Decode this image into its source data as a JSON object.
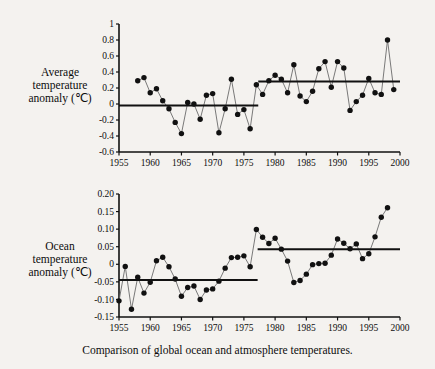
{
  "figure": {
    "caption": "Comparison of global ocean and atmosphere temperatures."
  },
  "chart_data": [
    {
      "type": "scatter",
      "name": "average-temperature-anomaly",
      "title": "",
      "xlabel": "",
      "ylabel": "Average temperature anomaly (℃)",
      "ylabel_lines": [
        "Average",
        "temperature",
        "anomaly (℃)"
      ],
      "xlim": [
        1955,
        2000
      ],
      "ylim": [
        -0.6,
        1.0
      ],
      "xticks": [
        1955,
        1960,
        1965,
        1970,
        1975,
        1980,
        1985,
        1990,
        1995,
        2000
      ],
      "xtick_labels": [
        "1955",
        "1960",
        "1965",
        "1970",
        "1975",
        "1980",
        "1985",
        "1990",
        "1995",
        "2000"
      ],
      "yticks": [
        -0.6,
        -0.4,
        -0.2,
        0,
        0.2,
        0.4,
        0.6,
        0.8,
        1.0
      ],
      "ytick_labels": [
        "-0.6",
        "-0.4",
        "-0.2",
        "0",
        "0.2",
        "0.4",
        "0.6",
        "0.8",
        "1"
      ],
      "grid": false,
      "legend": false,
      "marker": "filled-circle",
      "connected": true,
      "x": [
        1958,
        1959,
        1960,
        1961,
        1962,
        1963,
        1964,
        1965,
        1966,
        1967,
        1968,
        1969,
        1970,
        1971,
        1972,
        1973,
        1974,
        1975,
        1976,
        1977,
        1978,
        1979,
        1980,
        1981,
        1982,
        1983,
        1984,
        1985,
        1986,
        1987,
        1988,
        1989,
        1990,
        1991,
        1992,
        1993,
        1994,
        1995,
        1996,
        1997,
        1998,
        1999
      ],
      "y": [
        0.29,
        0.33,
        0.14,
        0.19,
        0.04,
        -0.06,
        -0.23,
        -0.37,
        0.02,
        0.0,
        -0.19,
        0.11,
        0.13,
        -0.36,
        -0.06,
        0.31,
        -0.13,
        -0.07,
        -0.31,
        0.24,
        0.12,
        0.29,
        0.36,
        0.31,
        0.14,
        0.49,
        0.1,
        0.03,
        0.16,
        0.44,
        0.53,
        0.21,
        0.53,
        0.45,
        -0.08,
        0.03,
        0.11,
        0.32,
        0.14,
        0.12,
        0.8,
        0.18
      ],
      "trend_lines": [
        {
          "name": "mean-1955-1977",
          "x0": 1955,
          "x1": 1977.3,
          "value": -0.02
        },
        {
          "name": "mean-1977-2000",
          "x0": 1977.3,
          "x1": 2000,
          "value": 0.28
        }
      ]
    },
    {
      "type": "scatter",
      "name": "ocean-temperature-anomaly",
      "title": "",
      "xlabel": "",
      "ylabel": "Ocean temperature anomaly (℃)",
      "ylabel_lines": [
        "Ocean",
        "temperature",
        "anomaly (℃)"
      ],
      "xlim": [
        1955,
        2000
      ],
      "ylim": [
        -0.15,
        0.2
      ],
      "xticks": [
        1955,
        1960,
        1965,
        1970,
        1975,
        1980,
        1985,
        1990,
        1995,
        2000
      ],
      "xtick_labels": [
        "1955",
        "1960",
        "1965",
        "1970",
        "1975",
        "1980",
        "1985",
        "1990",
        "1995",
        "2000"
      ],
      "yticks": [
        -0.15,
        -0.1,
        -0.05,
        0,
        0.05,
        0.1,
        0.15,
        0.2
      ],
      "ytick_labels": [
        "-0.15",
        "-0.10",
        "-0.05",
        "0",
        "0.05",
        "0.10",
        "0.15",
        "0.20"
      ],
      "grid": false,
      "legend": false,
      "marker": "filled-circle",
      "connected": true,
      "x": [
        1955,
        1956,
        1957,
        1958,
        1959,
        1960,
        1961,
        1962,
        1963,
        1964,
        1965,
        1966,
        1967,
        1968,
        1969,
        1970,
        1971,
        1972,
        1973,
        1974,
        1975,
        1976,
        1977,
        1978,
        1979,
        1980,
        1981,
        1982,
        1983,
        1984,
        1985,
        1986,
        1987,
        1988,
        1989,
        1990,
        1991,
        1992,
        1993,
        1994,
        1995,
        1996,
        1997,
        1998
      ],
      "y": [
        -0.104,
        -0.006,
        -0.128,
        -0.037,
        -0.082,
        -0.051,
        0.01,
        0.02,
        -0.007,
        -0.042,
        -0.091,
        -0.066,
        -0.062,
        -0.1,
        -0.073,
        -0.07,
        -0.048,
        -0.011,
        0.019,
        0.02,
        0.024,
        -0.007,
        0.099,
        0.077,
        0.059,
        0.074,
        0.043,
        0.009,
        -0.052,
        -0.046,
        -0.028,
        -0.001,
        0.002,
        0.003,
        0.026,
        0.072,
        0.06,
        0.044,
        0.058,
        0.016,
        0.03,
        0.078,
        0.134,
        0.161
      ],
      "trend_lines": [
        {
          "name": "mean-1955-1977",
          "x0": 1955,
          "x1": 1977.2,
          "value": -0.045
        },
        {
          "name": "mean-1977-2000",
          "x0": 1977.2,
          "x1": 2000,
          "value": 0.043
        }
      ]
    }
  ]
}
